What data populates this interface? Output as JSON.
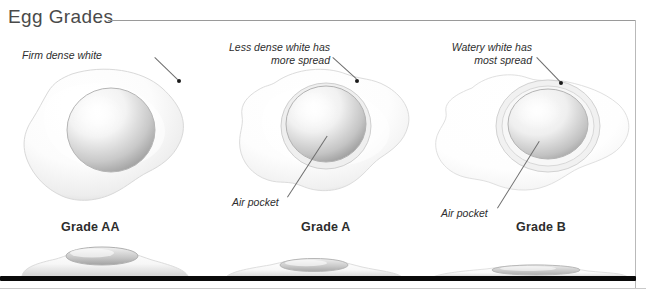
{
  "figure": {
    "title": "Egg Grades",
    "type": "illustrated-diagram"
  },
  "panels": [
    {
      "id": "grade-aa",
      "grade_label": "Grade AA",
      "callouts": [
        {
          "name": "white-callout",
          "text": "Firm dense white"
        }
      ]
    },
    {
      "id": "grade-a",
      "grade_label": "Grade A",
      "callouts": [
        {
          "name": "white-callout",
          "text": "Less dense white has\nmore spread"
        },
        {
          "name": "air-pocket-callout",
          "text": "Air pocket"
        }
      ]
    },
    {
      "id": "grade-b",
      "grade_label": "Grade B",
      "callouts": [
        {
          "name": "white-callout",
          "text": "Watery white has\nmost spread"
        },
        {
          "name": "air-pocket-callout",
          "text": "Air pocket"
        }
      ]
    }
  ],
  "colors": {
    "title": "#4a4a4a",
    "rule": "#9a9a9a",
    "baseline": "#0a0a0a",
    "label": "#2d2d2d",
    "leader": "#6d6d6d",
    "egg_white": "#ffffff",
    "egg_white_shadow": "#d8d8d8",
    "yolk_light": "#fbfbfb",
    "yolk_shadow": "#9d9d9d"
  }
}
